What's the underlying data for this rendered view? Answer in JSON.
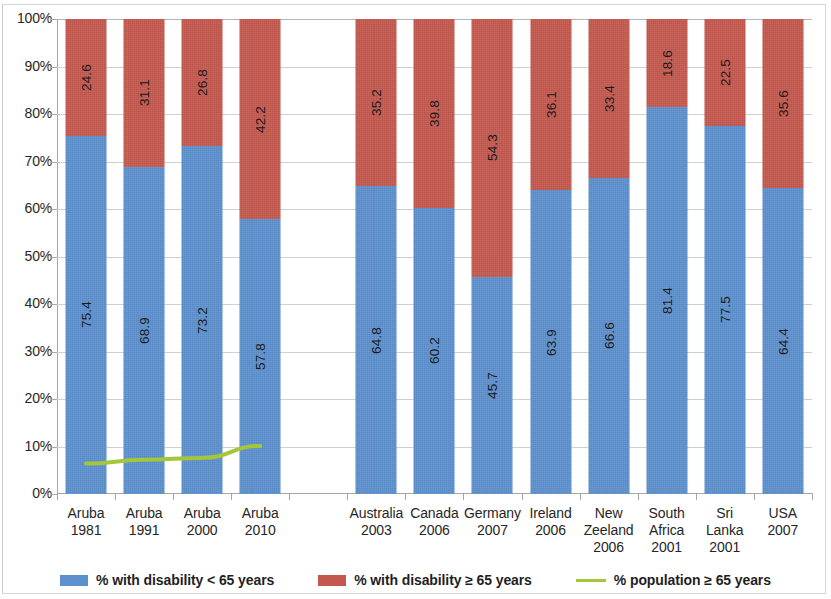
{
  "chart_data": {
    "type": "bar",
    "subtype": "stacked-100-percent-with-line-overlay",
    "title": "",
    "xlabel": "",
    "ylabel": "",
    "ylim": [
      0,
      100
    ],
    "ytick_labels": [
      "100%",
      "90%",
      "80%",
      "70%",
      "60%",
      "50%",
      "40%",
      "30%",
      "20%",
      "10%",
      "0%"
    ],
    "ytick_values": [
      100,
      90,
      80,
      70,
      60,
      50,
      40,
      30,
      20,
      10,
      0
    ],
    "grid": true,
    "legend_position": "bottom",
    "categories": [
      "Aruba 1981",
      "Aruba 1991",
      "Aruba 2000",
      "Aruba 2010",
      "",
      "Australia 2003",
      "Canada 2006",
      "Germany 2007",
      "Ireland 2006",
      "New Zeeland 2006",
      "South Africa 2001",
      "Sri Lanka 2001",
      "USA 2007"
    ],
    "category_lines": [
      [
        "Aruba",
        "1981"
      ],
      [
        "Aruba",
        "1991"
      ],
      [
        "Aruba",
        "2000"
      ],
      [
        "Aruba",
        "2010"
      ],
      [
        "",
        ""
      ],
      [
        "Australia",
        "2003"
      ],
      [
        "Canada",
        "2006"
      ],
      [
        "Germany",
        "2007"
      ],
      [
        "Ireland",
        "2006"
      ],
      [
        "New",
        "Zeeland",
        "2006"
      ],
      [
        "South",
        "Africa",
        "2001"
      ],
      [
        "Sri Lanka",
        "2001"
      ],
      [
        "USA 2007",
        ""
      ]
    ],
    "series": [
      {
        "name": "% with disability < 65 years",
        "color": "#5b8fcd",
        "type": "bar-segment-lower",
        "values": [
          75.4,
          68.9,
          73.2,
          57.8,
          null,
          64.8,
          60.2,
          45.7,
          63.9,
          66.6,
          81.4,
          77.5,
          64.4
        ]
      },
      {
        "name": "% with disability ≥ 65 years",
        "color": "#c4584e",
        "type": "bar-segment-upper",
        "values": [
          24.6,
          31.1,
          26.8,
          42.2,
          null,
          35.2,
          39.8,
          54.3,
          36.1,
          33.4,
          18.6,
          22.5,
          35.6
        ]
      },
      {
        "name": "% population ≥ 65 years",
        "color": "#a4c639",
        "type": "line",
        "values": [
          6.4,
          7.2,
          7.6,
          10.1,
          null,
          null,
          null,
          null,
          null,
          null,
          null,
          null,
          null
        ]
      }
    ],
    "legend": [
      {
        "label": "% with disability < 65 years",
        "marker": "blue-swatch",
        "color": "#5b8fcd"
      },
      {
        "label": "% with disability ≥ 65 years",
        "marker": "red-swatch",
        "color": "#c4584e"
      },
      {
        "label": "% population ≥ 65 years",
        "marker": "green-line",
        "color": "#a4c639"
      }
    ]
  },
  "colors": {
    "blue": "#5b8fcd",
    "red": "#c4584e",
    "green": "#a4c639",
    "grid": "#d0d0d0",
    "axis": "#a6a6a6",
    "text": "#262626",
    "background": "#ffffff"
  }
}
